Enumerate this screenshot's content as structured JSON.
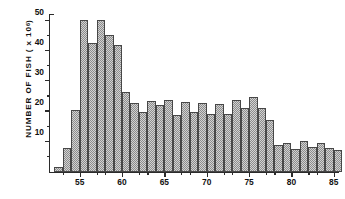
{
  "chart_data": {
    "type": "bar",
    "title": "",
    "subtitle": "",
    "xlabel": "",
    "ylabel": "NUMBER OF FISH ( x 10",
    "ylabel_exponent": "6",
    "ylabel_suffix": " )",
    "ylabel_full": "NUMBER OF FISH ( x 10^6 )",
    "grid": false,
    "legend": "none",
    "xlim": [
      51.5,
      85.5
    ],
    "ylim": [
      0,
      52
    ],
    "bar_width": 1,
    "yticks": [
      10,
      20,
      30,
      40,
      50
    ],
    "ytick_labels": [
      "10",
      "20",
      "30",
      "40",
      "50"
    ],
    "yticks_minor": [
      5,
      15,
      25,
      35,
      45
    ],
    "xticks": [
      55,
      60,
      65,
      70,
      75,
      80,
      85
    ],
    "xtick_labels": [
      "55",
      "60",
      "65",
      "70",
      "75",
      "80",
      "85"
    ],
    "xticks_minor": [
      53,
      57,
      58,
      62,
      63,
      67,
      68,
      72,
      73,
      77,
      78,
      82,
      83
    ],
    "categories": [
      52,
      53,
      54,
      55,
      56,
      57,
      58,
      59,
      60,
      61,
      62,
      63,
      64,
      65,
      66,
      67,
      68,
      69,
      70,
      71,
      72,
      73,
      74,
      75,
      76,
      77,
      78,
      79,
      80,
      81,
      82,
      83,
      84,
      85
    ],
    "values": [
      1.5,
      7.8,
      20.5,
      50.5,
      42.8,
      50.5,
      45.5,
      42.2,
      26.5,
      22.8,
      20.0,
      23.5,
      22.3,
      24.0,
      19.0,
      23.3,
      19.8,
      22.8,
      19.2,
      22.5,
      19.3,
      24.0,
      21.2,
      25.0,
      21.3,
      17.2,
      8.8,
      9.5,
      7.7,
      10.2,
      8.3,
      9.7,
      7.8,
      7.3
    ],
    "colors": {
      "bar_fill": "#d2d2d2",
      "bar_hatch": "#8c8c8c",
      "bar_edge": "#474747",
      "axis": "#2b2b2b",
      "text": "#111111",
      "background": "#ffffff"
    }
  }
}
